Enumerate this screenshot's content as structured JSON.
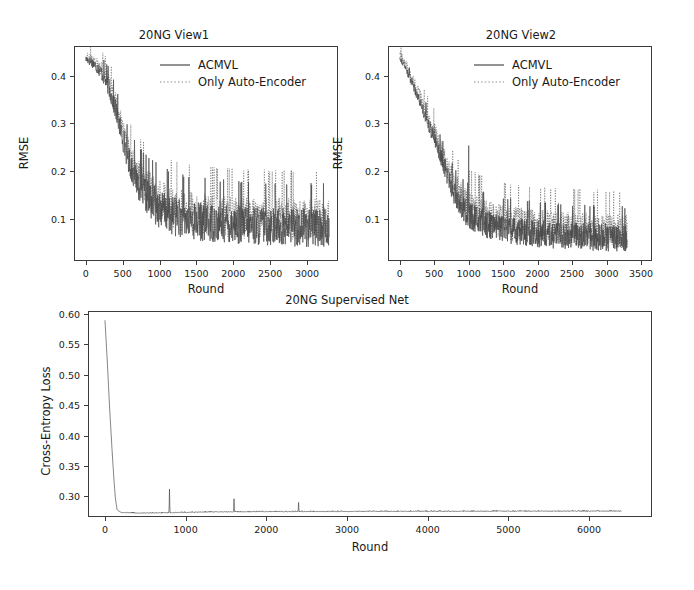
{
  "figure": {
    "background": "#ffffff",
    "line_color": "#4a4a4a",
    "axis_color": "#3c3c3c"
  },
  "chart_data": [
    {
      "id": "view1",
      "type": "line",
      "title": "20NG View1",
      "xlabel": "Round",
      "ylabel": "RMSE",
      "xlim": [
        -160,
        3420
      ],
      "ylim": [
        0.012,
        0.462
      ],
      "xticks": [
        0,
        500,
        1000,
        1500,
        2000,
        2500,
        3000
      ],
      "xticklabels": [
        "0",
        "500",
        "1000",
        "1500",
        "2000",
        "2500",
        "3000"
      ],
      "yticks": [
        0.1,
        0.2,
        0.3,
        0.4
      ],
      "yticklabels": [
        "0.1",
        "0.2",
        "0.3",
        "0.4"
      ],
      "grid": false,
      "legend_position": "upper center",
      "series": [
        {
          "name": "ACMVL",
          "style": "solid",
          "color": "#4a4a4a",
          "description": "RMSE decays from about 0.435 at round 0 to a noisy plateau near 0.075 after round 1200, oscillating between roughly 0.03 and 0.15",
          "anchors": [
            [
              0,
              0.434
            ],
            [
              100,
              0.425
            ],
            [
              200,
              0.408
            ],
            [
              300,
              0.378
            ],
            [
              400,
              0.33
            ],
            [
              500,
              0.268
            ],
            [
              600,
              0.212
            ],
            [
              700,
              0.176
            ],
            [
              800,
              0.15
            ],
            [
              900,
              0.132
            ],
            [
              1000,
              0.118
            ],
            [
              1200,
              0.102
            ],
            [
              1400,
              0.094
            ],
            [
              1600,
              0.09
            ],
            [
              1800,
              0.087
            ],
            [
              2000,
              0.085
            ],
            [
              2200,
              0.083
            ],
            [
              2400,
              0.082
            ],
            [
              2600,
              0.081
            ],
            [
              2800,
              0.08
            ],
            [
              3000,
              0.079
            ],
            [
              3200,
              0.078
            ],
            [
              3300,
              0.078
            ]
          ],
          "noise_amplitude": 0.042,
          "noise_seed": 17
        },
        {
          "name": "Only Auto-Encoder",
          "style": "dotted",
          "color": "#4a4a4a",
          "description": "Tracks ACMVL closely but plateaus slightly higher, near 0.095, with comparable high-frequency noise",
          "anchors": [
            [
              0,
              0.442
            ],
            [
              100,
              0.432
            ],
            [
              200,
              0.416
            ],
            [
              300,
              0.388
            ],
            [
              400,
              0.342
            ],
            [
              500,
              0.282
            ],
            [
              600,
              0.226
            ],
            [
              700,
              0.19
            ],
            [
              800,
              0.166
            ],
            [
              900,
              0.148
            ],
            [
              1000,
              0.136
            ],
            [
              1200,
              0.118
            ],
            [
              1400,
              0.11
            ],
            [
              1600,
              0.106
            ],
            [
              1800,
              0.103
            ],
            [
              2000,
              0.101
            ],
            [
              2200,
              0.099
            ],
            [
              2400,
              0.098
            ],
            [
              2600,
              0.097
            ],
            [
              2800,
              0.096
            ],
            [
              3000,
              0.095
            ],
            [
              3200,
              0.094
            ],
            [
              3300,
              0.094
            ]
          ],
          "noise_amplitude": 0.046,
          "noise_seed": 43
        }
      ]
    },
    {
      "id": "view2",
      "type": "line",
      "title": "20NG View2",
      "xlabel": "Round",
      "ylabel": "RMSE",
      "xlim": [
        -170,
        3660
      ],
      "ylim": [
        0.012,
        0.462
      ],
      "xticks": [
        0,
        500,
        1000,
        1500,
        2000,
        2500,
        3000,
        3500
      ],
      "xticklabels": [
        "0",
        "500",
        "1000",
        "1500",
        "2000",
        "2500",
        "3000",
        "3500"
      ],
      "yticks": [
        0.1,
        0.2,
        0.3,
        0.4
      ],
      "yticklabels": [
        "0.1",
        "0.2",
        "0.3",
        "0.4"
      ],
      "grid": false,
      "legend_position": "upper center",
      "series": [
        {
          "name": "ACMVL",
          "style": "solid",
          "color": "#4a4a4a",
          "description": "Steady decay from about 0.44 to a noisy floor near 0.055, with a single tall isolated spike to about 0.30 near round 1000",
          "anchors": [
            [
              0,
              0.438
            ],
            [
              100,
              0.41
            ],
            [
              200,
              0.378
            ],
            [
              300,
              0.342
            ],
            [
              400,
              0.305
            ],
            [
              500,
              0.268
            ],
            [
              600,
              0.228
            ],
            [
              700,
              0.186
            ],
            [
              800,
              0.15
            ],
            [
              900,
              0.122
            ],
            [
              1000,
              0.105
            ],
            [
              1200,
              0.09
            ],
            [
              1400,
              0.08
            ],
            [
              1600,
              0.074
            ],
            [
              1800,
              0.07
            ],
            [
              2000,
              0.067
            ],
            [
              2200,
              0.065
            ],
            [
              2400,
              0.063
            ],
            [
              2600,
              0.062
            ],
            [
              2800,
              0.06
            ],
            [
              3000,
              0.059
            ],
            [
              3200,
              0.058
            ],
            [
              3300,
              0.057
            ]
          ],
          "noise_amplitude": 0.03,
          "noise_seed": 91,
          "spikes": [
            [
              1000,
              0.3
            ]
          ]
        },
        {
          "name": "Only Auto-Encoder",
          "style": "dotted",
          "color": "#4a4a4a",
          "description": "Nearly overlapping with ACMVL during decay, settling a little higher near 0.07 with occasional upward excursions",
          "anchors": [
            [
              0,
              0.448
            ],
            [
              100,
              0.42
            ],
            [
              200,
              0.388
            ],
            [
              300,
              0.352
            ],
            [
              400,
              0.316
            ],
            [
              500,
              0.28
            ],
            [
              600,
              0.24
            ],
            [
              700,
              0.198
            ],
            [
              800,
              0.164
            ],
            [
              900,
              0.138
            ],
            [
              1000,
              0.12
            ],
            [
              1200,
              0.104
            ],
            [
              1400,
              0.094
            ],
            [
              1600,
              0.088
            ],
            [
              1800,
              0.084
            ],
            [
              2000,
              0.081
            ],
            [
              2200,
              0.079
            ],
            [
              2400,
              0.077
            ],
            [
              2600,
              0.076
            ],
            [
              2800,
              0.074
            ],
            [
              3000,
              0.073
            ],
            [
              3200,
              0.072
            ],
            [
              3300,
              0.071
            ]
          ],
          "noise_amplitude": 0.038,
          "noise_seed": 58
        }
      ]
    },
    {
      "id": "supervised",
      "type": "line",
      "title": "20NG Supervised Net",
      "xlabel": "Round",
      "ylabel": "Cross-Entropy Loss",
      "xlim": [
        -210,
        6780
      ],
      "ylim": [
        0.266,
        0.605
      ],
      "xticks": [
        0,
        1000,
        2000,
        3000,
        4000,
        5000,
        6000
      ],
      "xticklabels": [
        "0",
        "1000",
        "2000",
        "3000",
        "4000",
        "5000",
        "6000"
      ],
      "yticks": [
        0.3,
        0.35,
        0.4,
        0.45,
        0.5,
        0.55,
        0.6
      ],
      "yticklabels": [
        "0.30",
        "0.35",
        "0.40",
        "0.45",
        "0.50",
        "0.55",
        "0.60"
      ],
      "grid": false,
      "legend_position": "none",
      "series": [
        {
          "name": "Supervised Net Loss",
          "style": "solid",
          "color": "#4a4a4a",
          "description": "Loss starts near 0.59, plunges almost vertically to about 0.275 by round 150, then remains essentially flat to round 6400 with three narrow spikes at roughly rounds 800, 1600 and 2400 of decreasing height",
          "anchors": [
            [
              0,
              0.59
            ],
            [
              30,
              0.52
            ],
            [
              60,
              0.44
            ],
            [
              90,
              0.372
            ],
            [
              110,
              0.33
            ],
            [
              130,
              0.296
            ],
            [
              150,
              0.278
            ],
            [
              200,
              0.2735
            ],
            [
              400,
              0.2725
            ],
            [
              800,
              0.273
            ],
            [
              1200,
              0.2742
            ],
            [
              2000,
              0.2748
            ],
            [
              3000,
              0.2752
            ],
            [
              4000,
              0.2754
            ],
            [
              5000,
              0.2756
            ],
            [
              6000,
              0.2757
            ],
            [
              6400,
              0.2758
            ]
          ],
          "noise_amplitude": 0.0006,
          "noise_seed": 5,
          "spikes": [
            [
              800,
              0.312
            ],
            [
              1600,
              0.296
            ],
            [
              2400,
              0.29
            ]
          ]
        }
      ]
    }
  ]
}
